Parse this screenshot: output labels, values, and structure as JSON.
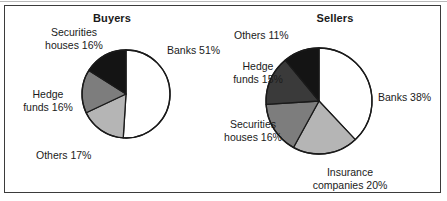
{
  "panels": [
    {
      "title": "Buyers"
    },
    {
      "title": "Sellers"
    }
  ],
  "labels": {
    "buyers": {
      "securities_l1": "Securities",
      "securities_l2": "houses 16%",
      "banks": "Banks 51%",
      "hedge_l1": "Hedge",
      "hedge_l2": "funds 16%",
      "others": "Others 17%"
    },
    "sellers": {
      "others": "Others 11%",
      "banks": "Banks 38%",
      "hedge_l1": "Hedge",
      "hedge_l2": "funds 15%",
      "securities_l1": "Securities",
      "securities_l2": "houses 16%",
      "insurance_l1": "Insurance",
      "insurance_l2": "companies 20%"
    }
  },
  "colors": {
    "white": "#ffffff",
    "light_gray": "#b5b5b5",
    "medium_gray": "#7d7d7d",
    "dark_gray": "#3a3a3a",
    "black": "#141414",
    "outline": "#1a1a1a",
    "frame": "#3b3b3b"
  },
  "chart_data": [
    {
      "type": "pie",
      "title": "Buyers",
      "start_angle_deg": 0,
      "direction": "clockwise",
      "categories": [
        "Banks",
        "Others",
        "Hedge funds",
        "Securities houses"
      ],
      "values": [
        51,
        17,
        16,
        16
      ],
      "unit": "%",
      "labels": [
        "Banks 51%",
        "Others 17%",
        "Hedge funds 16%",
        "Securities houses 16%"
      ],
      "slice_colors": [
        "#ffffff",
        "#b5b5b5",
        "#7d7d7d",
        "#141414"
      ],
      "center": [
        126,
        94
      ],
      "radius": 44,
      "legend": "none",
      "grid": false
    },
    {
      "type": "pie",
      "title": "Sellers",
      "start_angle_deg": 0,
      "direction": "clockwise",
      "categories": [
        "Banks",
        "Insurance companies",
        "Securities houses",
        "Hedge funds",
        "Others"
      ],
      "values": [
        38,
        20,
        16,
        15,
        11
      ],
      "unit": "%",
      "labels": [
        "Banks 38%",
        "Insurance companies 20%",
        "Securities houses 16%",
        "Hedge funds 15%",
        "Others 11%"
      ],
      "slice_colors": [
        "#ffffff",
        "#b5b5b5",
        "#7d7d7d",
        "#3a3a3a",
        "#141414"
      ],
      "center": [
        319,
        101
      ],
      "radius": 53,
      "legend": "none",
      "grid": false
    }
  ]
}
